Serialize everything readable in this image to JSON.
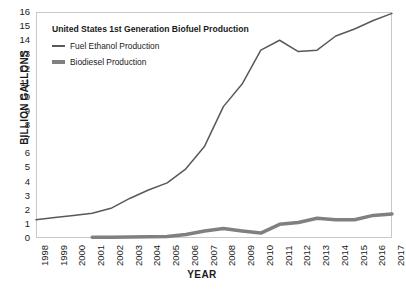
{
  "chart_data": {
    "type": "line",
    "title": "United States 1st Generation Biofuel Production",
    "xlabel": "YEAR",
    "ylabel": "BILLION GALLONS",
    "grid": false,
    "legend_position": "top-left",
    "x": [
      1998,
      1999,
      2000,
      2001,
      2002,
      2003,
      2004,
      2005,
      2006,
      2007,
      2008,
      2009,
      2010,
      2011,
      2012,
      2013,
      2014,
      2015,
      2016,
      2017
    ],
    "xtick_labels": [
      "1998",
      "1999",
      "2000",
      "2001",
      "2002",
      "2003",
      "2004",
      "2005",
      "2006",
      "2007",
      "2008",
      "2009",
      "2010",
      "2011",
      "2012",
      "2013",
      "2014",
      "2015",
      "2016",
      "2017"
    ],
    "ytick_labels": [
      "0",
      "1",
      "2",
      "3",
      "4",
      "5",
      "6",
      "7",
      "8",
      "9",
      "10",
      "11",
      "12",
      "13",
      "14",
      "15",
      "16"
    ],
    "xlim": [
      1998,
      2017
    ],
    "ylim": [
      0,
      16
    ],
    "series": [
      {
        "name": "Fuel Ethanol Production",
        "color": "#595959",
        "width": 1.5,
        "x": [
          1998,
          1999,
          2000,
          2001,
          2002,
          2003,
          2004,
          2005,
          2006,
          2007,
          2008,
          2009,
          2010,
          2011,
          2012,
          2013,
          2014,
          2015,
          2016,
          2017
        ],
        "values": [
          1.3,
          1.45,
          1.6,
          1.75,
          2.1,
          2.8,
          3.4,
          3.9,
          4.9,
          6.5,
          9.3,
          10.9,
          13.3,
          14.0,
          13.2,
          13.3,
          14.3,
          14.8,
          15.4,
          15.9
        ]
      },
      {
        "name": "Biodiesel Production",
        "color": "#808080",
        "width": 3.5,
        "x": [
          2001,
          2002,
          2003,
          2004,
          2005,
          2006,
          2007,
          2008,
          2009,
          2010,
          2011,
          2012,
          2013,
          2014,
          2015,
          2016,
          2017
        ],
        "values": [
          0.05,
          0.06,
          0.07,
          0.08,
          0.1,
          0.25,
          0.5,
          0.68,
          0.5,
          0.35,
          0.97,
          1.1,
          1.4,
          1.3,
          1.29,
          1.6,
          1.7
        ]
      }
    ]
  }
}
